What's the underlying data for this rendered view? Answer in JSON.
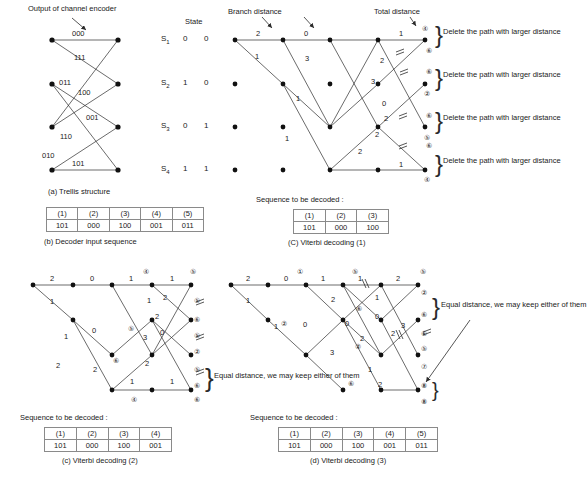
{
  "figure": {
    "panels": [
      {
        "id": "a",
        "caption": "(a) Trellis structure",
        "annotation": "Output of channel encoder",
        "state_header": "State",
        "states": [
          {
            "name": "S",
            "sub": "1",
            "bits": [
              "0",
              "0"
            ]
          },
          {
            "name": "S",
            "sub": "2",
            "bits": [
              "1",
              "0"
            ]
          },
          {
            "name": "S",
            "sub": "3",
            "bits": [
              "0",
              "1"
            ]
          },
          {
            "name": "S",
            "sub": "4",
            "bits": [
              "1",
              "1"
            ]
          }
        ],
        "edge_labels": [
          "000",
          "111",
          "011",
          "100",
          "001",
          "110",
          "010",
          "101"
        ]
      },
      {
        "id": "b",
        "caption": "(b) Decoder input sequence",
        "table": {
          "headers": [
            "(1)",
            "(2)",
            "(3)",
            "(4)",
            "(5)"
          ],
          "rows": [
            [
              "101",
              "000",
              "100",
              "001",
              "011"
            ]
          ]
        }
      },
      {
        "id": "c",
        "caption": "(C) Viterbi decoding (1)",
        "annotations": [
          "Branch distance",
          "Total distance"
        ],
        "notes": [
          "Delete the path with larger distance",
          "Delete the path with larger distance",
          "Delete the path with larger distance",
          "Delete the path with larger distance"
        ],
        "branch_labels": [
          "2",
          "0",
          "1",
          "1",
          "3",
          "2",
          "1",
          "3",
          "0",
          "2",
          "2",
          "2",
          "1"
        ],
        "total_labels": [
          "3",
          "4",
          "4",
          "2",
          "4",
          "5",
          "4",
          "4"
        ],
        "sequence_title": "Sequence to be decoded :",
        "table": {
          "headers": [
            "(1)",
            "(2)",
            "(3)"
          ],
          "rows": [
            [
              "101",
              "000",
              "100"
            ]
          ]
        }
      },
      {
        "id": "d",
        "caption": "(c) Viterbi decoding (2)",
        "note": "Equal distance, we may keep either of them",
        "branch_labels": [
          "2",
          "0",
          "1",
          "1",
          "1",
          "2",
          "0",
          "2",
          "1",
          "2",
          "0",
          "3",
          "2",
          "1",
          "1"
        ],
        "total_labels": [
          "3",
          "4",
          "4",
          "5",
          "4",
          "2",
          "5",
          "4",
          "5",
          "4",
          "5"
        ],
        "sequence_title": "Sequence to be decoded :",
        "table": {
          "headers": [
            "(1)",
            "(2)",
            "(3)",
            "(4)"
          ],
          "rows": [
            [
              "101",
              "000",
              "100",
              "001"
            ]
          ]
        }
      },
      {
        "id": "e",
        "caption": "(d) Viterbi decoding (3)",
        "note": "Equal distance, we may keep either of them",
        "branch_labels": [
          "2",
          "0",
          "1",
          "1",
          "1",
          "2",
          "1",
          "2",
          "0",
          "0",
          "0",
          "3",
          "3",
          "2",
          "1",
          "2"
        ],
        "total_labels": [
          "3",
          "4",
          "4",
          "2",
          "5",
          "5",
          "5",
          "2",
          "4",
          "6",
          "7",
          "7"
        ],
        "sequence_title": "Sequence to be decoded :",
        "table": {
          "headers": [
            "(1)",
            "(2)",
            "(3)",
            "(4)",
            "(5)"
          ],
          "rows": [
            [
              "101",
              "000",
              "100",
              "001",
              "011"
            ]
          ]
        }
      }
    ],
    "colors": {
      "line": "#2b2b2b",
      "node": "#111111",
      "text": "#1a1a1a",
      "grid": "#8a8a8a"
    }
  }
}
